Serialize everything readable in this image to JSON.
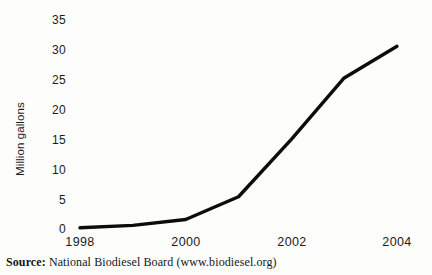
{
  "chart_data": {
    "type": "line",
    "title": "",
    "xlabel": "",
    "ylabel": "Million gallons",
    "x": [
      1998,
      1999,
      2000,
      2001,
      2002,
      2003,
      2004
    ],
    "values": [
      0.2,
      0.6,
      1.6,
      5.4,
      15.0,
      25.3,
      30.6
    ],
    "series": [
      {
        "name": "Biodiesel production",
        "values": [
          0.2,
          0.6,
          1.6,
          5.4,
          15.0,
          25.3,
          30.6
        ]
      }
    ],
    "x_tick_labels": [
      "1998",
      "2000",
      "2002",
      "2004"
    ],
    "x_tick_values": [
      1998,
      2000,
      2002,
      2004
    ],
    "y_tick_labels": [
      "0",
      "5",
      "10",
      "15",
      "20",
      "25",
      "30",
      "35"
    ],
    "y_tick_values": [
      0,
      5,
      10,
      15,
      20,
      25,
      30,
      35
    ],
    "xlim": [
      1998,
      2004
    ],
    "ylim": [
      0,
      35
    ],
    "grid": false,
    "legend": "none",
    "line_color": "#0c0c0c",
    "markers": false
  },
  "axes": {
    "y_title": "Million gallons",
    "y_ticks": [
      "35",
      "30",
      "25",
      "20",
      "15",
      "10",
      "5",
      "0"
    ],
    "x_ticks": [
      "1998",
      "2000",
      "2002",
      "2004"
    ]
  },
  "caption": {
    "label": "Source:",
    "text": " National Biodiesel Board (www.biodiesel.org)"
  },
  "colors": {
    "line": "#0c0c0c",
    "text": "#1b1b1b",
    "background": "#fdfdfc"
  }
}
